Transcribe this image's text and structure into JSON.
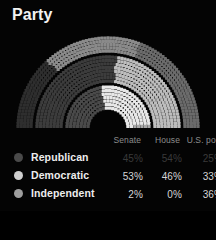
{
  "header": {
    "title": "Party"
  },
  "table": {
    "columns": [
      "",
      "Senate",
      "House",
      "U.S. pop."
    ],
    "col_party_header": "",
    "col_senate_header": "Senate",
    "col_house_header": "House",
    "col_pop_header": "U.S. pop.",
    "rows": [
      {
        "party": "Republican",
        "dot_color": "#4a4a4a",
        "senate": "45%",
        "house": "54%",
        "us_pop": "25%",
        "dimmed": true
      },
      {
        "party": "Democratic",
        "dot_color": "#cfcfcf",
        "senate": "53%",
        "house": "46%",
        "us_pop": "33%",
        "dimmed": false
      },
      {
        "party": "Independent",
        "dot_color": "#9e9e9e",
        "senate": "2%",
        "house": "0%",
        "us_pop": "36%",
        "dimmed": false
      }
    ]
  },
  "chart_data": {
    "type": "pie",
    "subtype": "nested-semicircle-dot-hemicycle",
    "title": "Party",
    "xlabel": "",
    "ylabel": "",
    "legend_position": "bottom",
    "grid": false,
    "background": "#040404",
    "rings": [
      {
        "name": "Senate",
        "ring_index": 0,
        "position": "inner",
        "total_dots": 100,
        "categories": [
          "Republican",
          "Democratic",
          "Independent"
        ],
        "values": [
          45,
          53,
          2
        ],
        "colors": [
          "#4a4a4a",
          "#e8e8e8",
          "#a8a8a8"
        ]
      },
      {
        "name": "House",
        "ring_index": 1,
        "position": "middle",
        "total_dots": 435,
        "categories": [
          "Republican",
          "Democratic",
          "Independent"
        ],
        "values": [
          54,
          46,
          0
        ],
        "colors": [
          "#3c3c3c",
          "#bdbdbd",
          "#8f8f8f"
        ]
      },
      {
        "name": "U.S. pop.",
        "ring_index": 2,
        "position": "outer",
        "total_dots": 600,
        "categories": [
          "Republican",
          "Democratic",
          "Independent"
        ],
        "values": [
          25,
          33,
          36
        ],
        "colors": [
          "#2e2e2e",
          "#8a8a8a",
          "#6b6b6b"
        ]
      }
    ],
    "colors": {
      "republican": "#4a4a4a",
      "democratic": "#cfcfcf",
      "independent": "#9e9e9e",
      "text": "#ededed",
      "muted_text": "#8c8c8c",
      "dim_text": "#3a3a3a"
    }
  }
}
